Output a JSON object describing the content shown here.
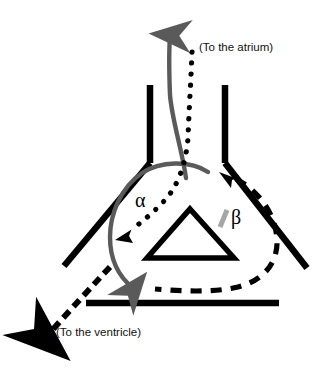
{
  "figure": {
    "type": "anatomical-schematic",
    "background_color": "#ffffff"
  },
  "labels": {
    "atrium": "(To the atrium)",
    "ventricle": "(To the ventricle)",
    "alpha": "α",
    "beta": "β"
  },
  "colors": {
    "structure_black": "#000000",
    "gray_flow": "#5a5a5a",
    "marker_gray": "#a6a6a6",
    "text": "#111111"
  },
  "elements": {
    "walls": [
      {
        "name": "left-upper-wall",
        "style": "solid-black-thick"
      },
      {
        "name": "left-lower-wall",
        "style": "solid-black-thick"
      },
      {
        "name": "right-upper-wall",
        "style": "solid-black-thick"
      },
      {
        "name": "right-lower-wall",
        "style": "solid-black-thick"
      },
      {
        "name": "bottom-horizontal-wall",
        "style": "solid-black-thick"
      }
    ],
    "valve": {
      "name": "central-triangle-valve",
      "style": "solid-black-outline"
    },
    "flows": [
      {
        "name": "gray-outflow-arrow-to-atrium",
        "style": "solid",
        "color": "#5a5a5a",
        "direction": "up"
      },
      {
        "name": "gray-loop-to-ventricle-arrow",
        "style": "solid",
        "color": "#5a5a5a",
        "direction": "down"
      },
      {
        "name": "dotted-flow-arrow",
        "style": "dotted",
        "color": "#000000",
        "direction": "down-left"
      },
      {
        "name": "dashed-flow-arrow",
        "style": "dashed",
        "color": "#000000",
        "direction": "up-left"
      },
      {
        "name": "dashed-outflow-to-ventricle",
        "style": "dashed",
        "color": "#000000",
        "direction": "down-left"
      }
    ],
    "annotations": [
      {
        "name": "beta-tick-mark",
        "style": "gray-slash",
        "color": "#a6a6a6"
      }
    ]
  }
}
